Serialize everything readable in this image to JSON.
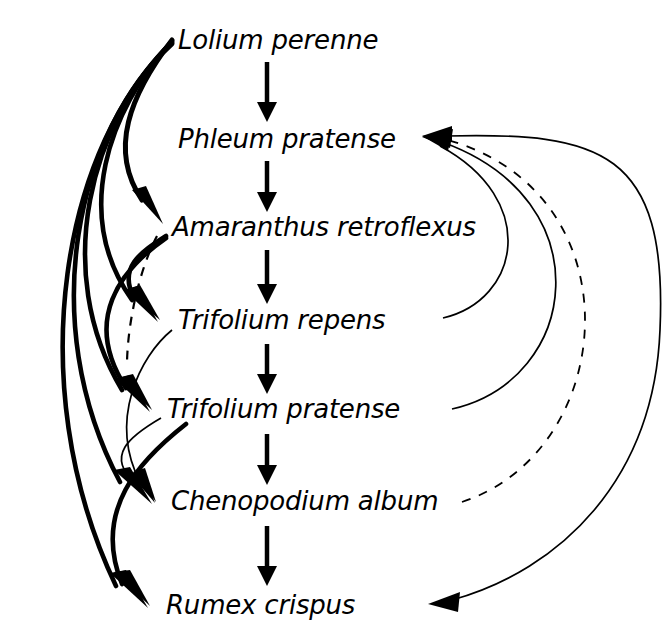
{
  "diagram": {
    "type": "directed-graph",
    "background_color": "#ffffff",
    "line_color": "#000000",
    "nodes": [
      {
        "id": "lolium",
        "label": "Lolium perenne",
        "x": 178,
        "y": 40,
        "left_x": 172,
        "right_x": 422
      },
      {
        "id": "phleum",
        "label": "Phleum pratense",
        "x": 178,
        "y": 139,
        "left_x": 172,
        "right_x": 430
      },
      {
        "id": "amaranthus",
        "label": "Amaranthus retroflexus",
        "x": 172,
        "y": 227,
        "left_x": 166,
        "right_x": 488
      },
      {
        "id": "trif_repens",
        "label": "Trifolium repens",
        "x": 178,
        "y": 320,
        "left_x": 172,
        "right_x": 420
      },
      {
        "id": "trif_prat",
        "label": "Trifolium pratense",
        "x": 167,
        "y": 409,
        "left_x": 161,
        "right_x": 432
      },
      {
        "id": "chenopodium",
        "label": "Chenopodium album",
        "x": 171,
        "y": 501,
        "left_x": 165,
        "right_x": 458
      },
      {
        "id": "rumex",
        "label": "Rumex crispus",
        "x": 166,
        "y": 605,
        "left_x": 160,
        "right_x": 430
      }
    ],
    "chain_arrows": [
      {
        "from": "lolium",
        "to": "phleum",
        "x": 267,
        "y1": 62,
        "y2": 118
      },
      {
        "from": "phleum",
        "to": "amaranthus",
        "x": 267,
        "y1": 161,
        "y2": 208
      },
      {
        "from": "amaranthus",
        "to": "trif_repens",
        "x": 267,
        "y1": 250,
        "y2": 300
      },
      {
        "from": "trif_repens",
        "to": "trif_prat",
        "x": 267,
        "y1": 342,
        "y2": 390
      },
      {
        "from": "trif_prat",
        "to": "chenopodium",
        "x": 267,
        "y1": 432,
        "y2": 481
      },
      {
        "from": "chenopodium",
        "to": "rumex",
        "x": 267,
        "y1": 524,
        "y2": 584
      }
    ],
    "left_edges": [
      {
        "from": "lolium",
        "to": "amaranthus",
        "style": "thick-solid",
        "width": 5.0
      },
      {
        "from": "lolium",
        "to": "trif_repens",
        "style": "thick-solid",
        "width": 4.6
      },
      {
        "from": "lolium",
        "to": "trif_prat",
        "style": "thick-solid",
        "width": 4.6
      },
      {
        "from": "lolium",
        "to": "chenopodium",
        "style": "thick-solid",
        "width": 4.6
      },
      {
        "from": "lolium",
        "to": "rumex",
        "style": "thick-solid",
        "width": 4.6
      },
      {
        "from": "amaranthus",
        "to": "trif_repens",
        "style": "thick-solid",
        "width": 4.6
      },
      {
        "from": "amaranthus",
        "to": "trif_prat",
        "style": "thick-solid",
        "width": 4.6
      },
      {
        "from": "amaranthus",
        "to": "chenopodium",
        "style": "dashed",
        "width": 2.0
      },
      {
        "from": "trif_repens",
        "to": "chenopodium",
        "style": "thin-solid",
        "width": 1.6
      },
      {
        "from": "trif_prat",
        "to": "chenopodium",
        "style": "thin-solid",
        "width": 1.6
      },
      {
        "from": "trif_prat",
        "to": "rumex",
        "style": "thick-solid",
        "width": 4.6
      }
    ],
    "right_edges": [
      {
        "from": "trif_repens",
        "to": "phleum",
        "style": "thin-solid",
        "width": 1.6
      },
      {
        "from": "trif_prat",
        "to": "phleum",
        "style": "thin-solid",
        "width": 1.6
      },
      {
        "from": "chenopodium",
        "to": "phleum",
        "style": "dashed",
        "width": 1.6
      },
      {
        "from": "rumex",
        "to": "phleum",
        "style": "thin-solid",
        "width": 1.6
      }
    ]
  }
}
